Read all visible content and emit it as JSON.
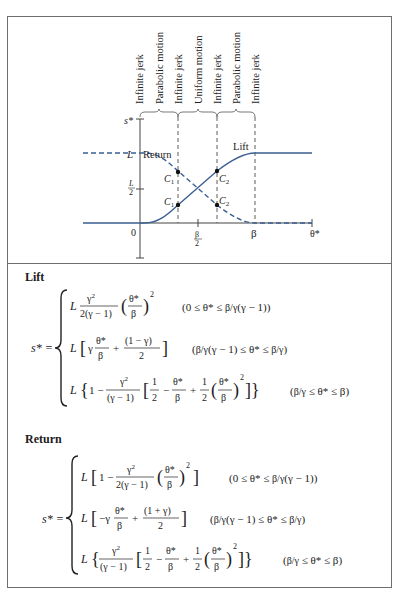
{
  "diagram": {
    "phase_labels": [
      "Infinite jerk",
      "Parabolic motion",
      "Infinite jerk",
      "Uniform motion",
      "Infinite jerk",
      "Parabolic motion",
      "Infinite jerk"
    ],
    "y_axis": {
      "label": "s*",
      "tick_L": "L",
      "tick_half_num": "L",
      "tick_half_den": "2"
    },
    "x_axis": {
      "label": "θ*",
      "origin": "0",
      "tick_half_num": "β",
      "tick_half_den": "2",
      "tick_end": "β"
    },
    "curves": [
      {
        "name": "Return",
        "style": "dashed",
        "color": "#3a5f93"
      },
      {
        "name": "Lift",
        "style": "solid",
        "color": "#3a5f93"
      }
    ],
    "points": [
      "C1",
      "C1",
      "C2",
      "C2"
    ],
    "point_labels": {
      "c1": "C",
      "c1_sub": "1",
      "c2": "C",
      "c2_sub": "2"
    }
  },
  "lift": {
    "title": "Lift",
    "lhs": "s* =",
    "rows": [
      {
        "expr": "L γ²/(2(γ − 1)) (θ*/β)²",
        "cond": "(0 ≤ θ* ≤ (β/γ)(γ − 1))"
      },
      {
        "expr": "L [γ θ*/β + (1 − γ)/2]",
        "cond": "((β/γ)(γ − 1) ≤ θ* ≤ β/γ)"
      },
      {
        "expr": "L {1 − γ²/(γ − 1) [1/2 − θ*/β + 1/2 (θ*/β)²]}",
        "cond": "(β/γ ≤ θ* ≤ β)"
      }
    ]
  },
  "return": {
    "title": "Return",
    "lhs": "s* =",
    "rows": [
      {
        "expr": "L [1 − γ²/(2(γ − 1)) (θ*/β)²]",
        "cond": "(0 ≤ θ* ≤ (β/γ)(γ − 1))"
      },
      {
        "expr": "L [−γ θ*/β + (1 + γ)/2]",
        "cond": "((β/γ)(γ − 1) ≤ θ* ≤ β/γ)"
      },
      {
        "expr": "L {γ²/(γ − 1) [1/2 − θ*/β + 1/2 (θ*/β)²]}",
        "cond": "(β/γ ≤ θ* ≤ β)"
      }
    ]
  },
  "glyphs": {
    "L": "L",
    "gamma": "γ",
    "beta": "β",
    "theta_star": "θ*",
    "two": "2",
    "one": "1",
    "sq": "2",
    "minus": "−",
    "plus": "+",
    "le": "≤",
    "zero": "0",
    "g_minus_1": "(γ − 1)",
    "two_g_minus_1": "2(γ − 1)",
    "one_minus_g": "(1 − γ)",
    "one_plus_g": "(1 + γ)",
    "neg_gamma": "−γ",
    "one_minus": "1 −"
  }
}
